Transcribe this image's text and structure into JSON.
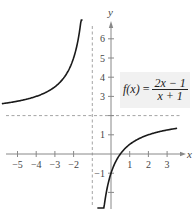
{
  "chart_data": {
    "type": "line",
    "title": "",
    "function_label": {
      "lhs": "f(x)",
      "equals": "=",
      "numerator": "2x − 1",
      "denominator": "x + 1"
    },
    "xlabel": "x",
    "ylabel": "y",
    "xlim": [
      -5.8,
      3.7
    ],
    "ylim": [
      -2.2,
      6.8
    ],
    "x_ticks": [
      -5,
      -4,
      -3,
      -2,
      1,
      2,
      3
    ],
    "x_tick_labels": [
      "−5",
      "−4",
      "−3",
      "−2",
      "1",
      "2",
      "3"
    ],
    "y_ticks": [
      6,
      5,
      4,
      3,
      1,
      -1
    ],
    "y_tick_labels": [
      "6",
      "5",
      "4",
      "3",
      "1",
      "−1"
    ],
    "y_ticks_unlabeled": [
      2,
      -2
    ],
    "asymptotes": {
      "vertical": {
        "x": -1,
        "style": "dashed"
      },
      "horizontal": {
        "y": 2,
        "style": "dashed"
      }
    },
    "grid": false,
    "series": [
      {
        "name": "left branch",
        "domain": [
          -5.8,
          -1.55
        ],
        "x": [
          -5.8,
          -5,
          -4,
          -3,
          -2.5,
          -2,
          -1.8,
          -1.6,
          -1.55
        ],
        "y": [
          2.625,
          2.75,
          3.0,
          3.5,
          4.0,
          5.0,
          5.75,
          7.0,
          7.45
        ]
      },
      {
        "name": "right branch",
        "domain": [
          -0.7,
          3.5
        ],
        "x": [
          -0.7,
          -0.5,
          0,
          0.5,
          1,
          2,
          3,
          3.5
        ],
        "y": [
          -8.0,
          -4.0,
          -1.0,
          0.0,
          0.5,
          1.0,
          1.25,
          1.333
        ]
      }
    ]
  },
  "colors": {
    "curve": "#1a1a1a",
    "axis": "#888888",
    "asymptote": "#9a9a9a",
    "label_box": "#f1f1f1"
  }
}
